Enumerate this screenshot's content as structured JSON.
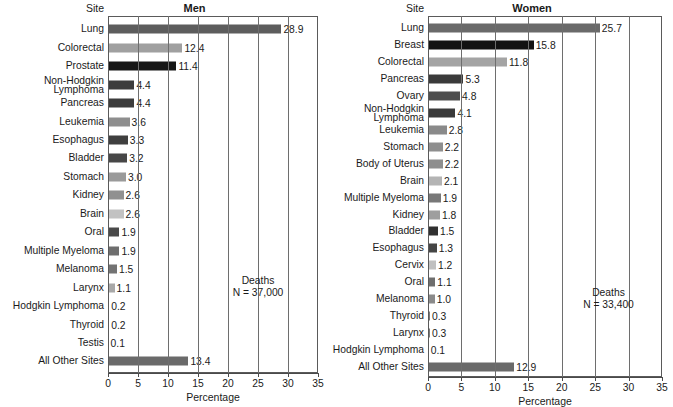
{
  "chart_data": [
    {
      "type": "bar",
      "title": "Men",
      "orientation": "horizontal",
      "xlabel": "Percentage",
      "ylabel": "Site",
      "xlim": [
        0,
        35
      ],
      "xticks": [
        0,
        5,
        10,
        15,
        20,
        25,
        30,
        35
      ],
      "xticklabels": [
        "0",
        "5",
        "10",
        "15",
        "20",
        "25",
        "30",
        "35"
      ],
      "grid": true,
      "legend": "none",
      "annotation_line1": "Deaths",
      "annotation_line2": "N = 37,000",
      "annotation_x": 25,
      "categories": [
        "Lung",
        "Colorectal",
        "Prostate",
        "Non-Hodgkin Lymphoma",
        "Pancreas",
        "Leukemia",
        "Esophagus",
        "Bladder",
        "Stomach",
        "Kidney",
        "Brain",
        "Oral",
        "Multiple Myeloma",
        "Melanoma",
        "Larynx",
        "Hodgkin Lymphoma",
        "Thyroid",
        "Testis",
        "All Other Sites"
      ],
      "values": [
        28.9,
        12.4,
        11.4,
        4.4,
        4.4,
        3.6,
        3.3,
        3.2,
        3.0,
        2.6,
        2.6,
        1.9,
        1.9,
        1.5,
        1.1,
        0.2,
        0.2,
        0.1,
        13.4
      ],
      "value_labels": [
        "28.9",
        "12.4",
        "11.4",
        "4.4",
        "4.4",
        "3.6",
        "3.3",
        "3.2",
        "3.0",
        "2.6",
        "2.6",
        "1.9",
        "1.9",
        "1.5",
        "1.1",
        "0.2",
        "0.2",
        "0.1",
        "13.4"
      ],
      "bar_colors": [
        "#5d5d5d",
        "#a0a0a0",
        "#161616",
        "#3c3c3c",
        "#3c3c3c",
        "#8e8e8e",
        "#3f3f3f",
        "#474747",
        "#9a9a9a",
        "#909090",
        "#c2c2c2",
        "#4a4a4a",
        "#6e6e6e",
        "#737373",
        "#a8a8a8",
        "#7a7a7a",
        "#7a7a7a",
        "#7a7a7a",
        "#6a6a6a"
      ]
    },
    {
      "type": "bar",
      "title": "Women",
      "orientation": "horizontal",
      "xlabel": "Percentage",
      "ylabel": "Site",
      "xlim": [
        0,
        35
      ],
      "xticks": [
        0,
        5,
        10,
        15,
        20,
        25,
        30,
        35
      ],
      "xticklabels": [
        "0",
        "5",
        "10",
        "15",
        "20",
        "25",
        "30",
        "35"
      ],
      "grid": true,
      "legend": "none",
      "annotation_line1": "Deaths",
      "annotation_line2": "N = 33,400",
      "annotation_x": 27,
      "categories": [
        "Lung",
        "Breast",
        "Colorectal",
        "Pancreas",
        "Ovary",
        "Non-Hodgkin Lymphoma",
        "Leukemia",
        "Stomach",
        "Body of Uterus",
        "Brain",
        "Multiple Myeloma",
        "Kidney",
        "Bladder",
        "Esophagus",
        "Cervix",
        "Oral",
        "Melanoma",
        "Thyroid",
        "Larynx",
        "Hodgkin Lymphoma",
        "All Other Sites"
      ],
      "values": [
        25.7,
        15.8,
        11.8,
        5.3,
        4.8,
        4.1,
        2.8,
        2.2,
        2.2,
        2.1,
        1.9,
        1.8,
        1.5,
        1.3,
        1.2,
        1.1,
        1.0,
        0.3,
        0.3,
        0.1,
        12.9
      ],
      "value_labels": [
        "25.7",
        "15.8",
        "11.8",
        "5.3",
        "4.8",
        "4.1",
        "2.8",
        "2.2",
        "2.2",
        "2.1",
        "1.9",
        "1.8",
        "1.5",
        "1.3",
        "1.2",
        "1.1",
        "1.0",
        "0.3",
        "0.3",
        "0.1",
        "12.9"
      ],
      "bar_colors": [
        "#6a6a6a",
        "#131313",
        "#a4a4a4",
        "#3a3a3a",
        "#4e4e4e",
        "#3a3a3a",
        "#8a8a8a",
        "#8e8e8e",
        "#8e8e8e",
        "#b4b4b4",
        "#787878",
        "#9e9e9e",
        "#303030",
        "#454545",
        "#c0c0c0",
        "#6e6e6e",
        "#8a8a8a",
        "#7a7a7a",
        "#7a7a7a",
        "#7a7a7a",
        "#6a6a6a"
      ]
    }
  ],
  "panels": {
    "men": {
      "site_header": "Site",
      "title": "Men",
      "axis_title": "Percentage",
      "deaths_label": "Deaths",
      "deaths_count": "N = 37,000"
    },
    "women": {
      "site_header": "Site",
      "title": "Women",
      "axis_title": "Percentage",
      "deaths_label": "Deaths",
      "deaths_count": "N = 33,400"
    }
  }
}
